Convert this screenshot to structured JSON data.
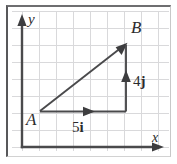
{
  "figure": {
    "background_color": "#ffffff",
    "grid_color": "#d9d9db",
    "axis_color": "#4a4a4c",
    "vector_color": "#4a4a4c",
    "label_color": "#2b2b2d",
    "border_color": "#58585a"
  },
  "axes": {
    "x_label": "x",
    "y_label": "y",
    "x_axis": {
      "origin_x": 16,
      "origin_y": 142,
      "end_x": 157,
      "end_y": 142
    },
    "y_axis": {
      "origin_x": 16,
      "origin_y": 142,
      "end_x": 16,
      "end_y": 14
    }
  },
  "grid": {
    "cell_size": 17,
    "vertical_lines": [
      16,
      33,
      50,
      67,
      84,
      101,
      118,
      135,
      152
    ],
    "horizontal_lines": [
      6,
      23,
      40,
      57,
      74,
      91,
      108,
      125,
      142
    ]
  },
  "points": [
    {
      "label": "A",
      "x": 34,
      "y": 106,
      "label_x": 22,
      "label_y": 117
    },
    {
      "label": "B",
      "x": 120,
      "y": 38,
      "label_x": 126,
      "label_y": 26
    }
  ],
  "vectors": [
    {
      "name": "resultant-vector-AB",
      "from": "A",
      "to": "B",
      "x1": 34,
      "y1": 106,
      "x2": 119,
      "y2": 39,
      "label": "",
      "arrow_at_end": true
    },
    {
      "name": "horizontal-component-vector",
      "label": "5i",
      "magnitude": 5,
      "unit": "i",
      "x1": 34,
      "y1": 106,
      "x2": 120,
      "y2": 106,
      "midpoint_arrow_x": 82,
      "label_x": 73,
      "label_y": 125
    },
    {
      "name": "vertical-component-vector",
      "label": "4j",
      "magnitude": 4,
      "unit": "j",
      "x1": 120,
      "y1": 106,
      "x2": 120,
      "y2": 39,
      "midpoint_arrow_y": 73,
      "label_x": 128,
      "label_y": 78
    }
  ],
  "annotations": {
    "horizontal_number": "5",
    "horizontal_unit": "i",
    "vertical_number": "4",
    "vertical_unit": "j"
  }
}
